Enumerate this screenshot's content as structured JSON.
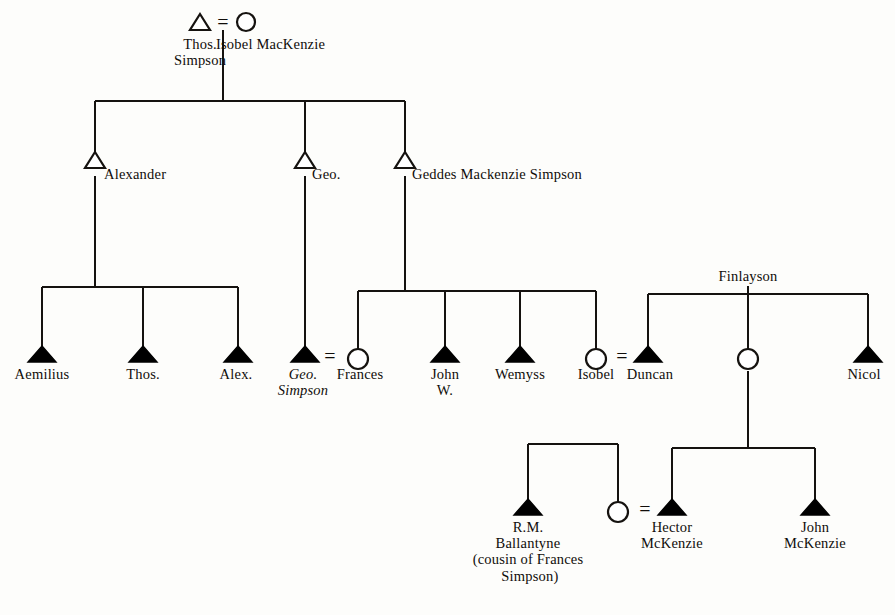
{
  "diagram": {
    "type": "genealogy-pedigree-chart",
    "title": "",
    "legend": {
      "open_triangle": "male (ancestor generation)",
      "filled_triangle": "male",
      "open_circle": "female",
      "equals_sign": "marriage"
    },
    "marriage_symbol": "="
  },
  "generations": [
    {
      "id": "gen1",
      "people": [
        {
          "id": "thos_simpson",
          "label": "Thos.\nSimpson",
          "sex": "male",
          "symbol": "open-triangle",
          "x": 200,
          "y": 24,
          "label_x": 200,
          "label_y": 36,
          "italic": false,
          "align": "center"
        },
        {
          "id": "isobel_mackenzie",
          "label": "Isobel MacKenzie",
          "sex": "female",
          "symbol": "open-circle",
          "x": 246,
          "y": 24,
          "label_x": 216,
          "label_y": 36,
          "italic": false,
          "align": "left"
        }
      ],
      "marriages": [
        {
          "id": "m_thos_isobel",
          "left": "thos_simpson",
          "right": "isobel_mackenzie",
          "symbol": "=",
          "x": 223,
          "y": 24
        }
      ]
    },
    {
      "id": "gen2",
      "people": [
        {
          "id": "alexander",
          "label": "Alexander",
          "sex": "male",
          "symbol": "open-triangle",
          "x": 95,
          "y": 168,
          "label_x": 104,
          "label_y": 166,
          "italic": false,
          "align": "left"
        },
        {
          "id": "geo",
          "label": "Geo.",
          "sex": "male",
          "symbol": "open-triangle",
          "x": 305,
          "y": 168,
          "label_x": 312,
          "label_y": 166,
          "italic": false,
          "align": "left"
        },
        {
          "id": "geddes_mackenzie_simpson",
          "label": "Geddes Mackenzie Simpson",
          "sex": "male",
          "symbol": "open-triangle",
          "x": 405,
          "y": 168,
          "label_x": 412,
          "label_y": 166,
          "italic": false,
          "align": "left"
        }
      ]
    },
    {
      "id": "gen3",
      "people": [
        {
          "id": "aemilius",
          "label": "Aemilius",
          "sex": "male",
          "symbol": "filled-triangle",
          "x": 42,
          "y": 361,
          "label_x": 42,
          "label_y": 366,
          "italic": false,
          "align": "center"
        },
        {
          "id": "thos_jr",
          "label": "Thos.",
          "sex": "male",
          "symbol": "filled-triangle",
          "x": 143,
          "y": 361,
          "label_x": 143,
          "label_y": 366,
          "italic": false,
          "align": "center"
        },
        {
          "id": "alex",
          "label": "Alex.",
          "sex": "male",
          "symbol": "filled-triangle",
          "x": 238,
          "y": 361,
          "label_x": 236,
          "label_y": 366,
          "italic": false,
          "align": "center"
        },
        {
          "id": "geo_simpson",
          "label": "Geo.\nSimpson",
          "sex": "male",
          "symbol": "filled-triangle",
          "x": 305,
          "y": 361,
          "label_x": 303,
          "label_y": 366,
          "italic": true,
          "align": "center"
        },
        {
          "id": "frances",
          "label": "Frances",
          "sex": "female",
          "symbol": "open-circle",
          "x": 358,
          "y": 360,
          "label_x": 360,
          "label_y": 366,
          "italic": false,
          "align": "center"
        },
        {
          "id": "john_w",
          "label": "John\nW.",
          "sex": "male",
          "symbol": "filled-triangle",
          "x": 445,
          "y": 361,
          "label_x": 445,
          "label_y": 366,
          "italic": false,
          "align": "center"
        },
        {
          "id": "wemyss",
          "label": "Wemyss",
          "sex": "male",
          "symbol": "filled-triangle",
          "x": 520,
          "y": 361,
          "label_x": 520,
          "label_y": 366,
          "italic": false,
          "align": "center"
        },
        {
          "id": "isobel_jr",
          "label": "Isobel",
          "sex": "female",
          "symbol": "open-circle",
          "x": 596,
          "y": 360,
          "label_x": 596,
          "label_y": 366,
          "italic": false,
          "align": "center"
        },
        {
          "id": "duncan",
          "label": "Duncan",
          "sex": "male",
          "symbol": "filled-triangle",
          "x": 648,
          "y": 361,
          "label_x": 650,
          "label_y": 366,
          "italic": false,
          "align": "center"
        },
        {
          "id": "finlayson_daughter",
          "label": "",
          "sex": "female",
          "symbol": "open-circle",
          "x": 748,
          "y": 360,
          "label_x": 748,
          "label_y": 366,
          "italic": false,
          "align": "center"
        },
        {
          "id": "nicol",
          "label": "Nicol",
          "sex": "male",
          "symbol": "filled-triangle",
          "x": 868,
          "y": 361,
          "label_x": 864,
          "label_y": 366,
          "italic": false,
          "align": "center"
        }
      ],
      "marriages": [
        {
          "id": "m_geo_frances",
          "left": "geo_simpson",
          "right": "frances",
          "symbol": "=",
          "x": 330,
          "y": 356
        },
        {
          "id": "m_isobel_duncan",
          "left": "isobel_jr",
          "right": "duncan",
          "symbol": "=",
          "x": 622,
          "y": 356
        }
      ]
    },
    {
      "id": "gen4",
      "people": [
        {
          "id": "rm_ballantyne",
          "label": "R.M.\nBallantyne\n(cousin of Frances\n Simpson)",
          "sex": "male",
          "symbol": "filled-triangle",
          "x": 528,
          "y": 514,
          "label_x": 528,
          "label_y": 519,
          "italic": false,
          "align": "center"
        },
        {
          "id": "ballantyne_sister",
          "label": "",
          "sex": "female",
          "symbol": "open-circle",
          "x": 618,
          "y": 513,
          "label_x": 618,
          "label_y": 519,
          "italic": false,
          "align": "center"
        },
        {
          "id": "hector_mckenzie",
          "label": "Hector\nMcKenzie",
          "sex": "male",
          "symbol": "filled-triangle",
          "x": 672,
          "y": 514,
          "label_x": 672,
          "label_y": 519,
          "italic": false,
          "align": "center"
        },
        {
          "id": "john_mckenzie",
          "label": "John\nMcKenzie",
          "sex": "male",
          "symbol": "filled-triangle",
          "x": 815,
          "y": 514,
          "label_x": 815,
          "label_y": 519,
          "italic": false,
          "align": "center"
        }
      ],
      "marriages": [
        {
          "id": "m_sister_hector",
          "left": "ballantyne_sister",
          "right": "hector_mckenzie",
          "symbol": "=",
          "x": 645,
          "y": 509
        }
      ]
    }
  ],
  "family_labels": [
    {
      "id": "finlayson",
      "label": "Finlayson",
      "x": 748,
      "y": 268
    }
  ],
  "notes": {
    "ballantyne_note": "(cousin of Frances Simpson)"
  },
  "colors": {
    "ink": "#15120f",
    "paper": "#fdfdfb",
    "symbol_fill": "#000000"
  }
}
